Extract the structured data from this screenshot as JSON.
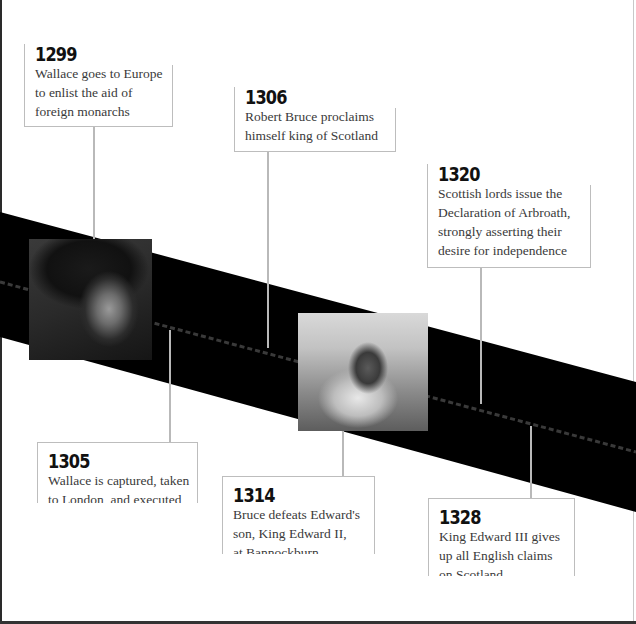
{
  "timeline": {
    "band_color": "#000000",
    "connector_color": "#b9b9b9",
    "events": [
      {
        "year": "1299",
        "description_lines": [
          "Wallace goes to Europe",
          "to enlist the aid of",
          "foreign monarchs"
        ],
        "position": "above"
      },
      {
        "year": "1306",
        "description_lines": [
          "Robert Bruce proclaims",
          "himself king of Scotland"
        ],
        "position": "above"
      },
      {
        "year": "1320",
        "description_lines": [
          "Scottish lords issue the",
          "Declaration of Arbroath,",
          "strongly asserting their",
          "desire for independence"
        ],
        "position": "above"
      },
      {
        "year": "1305",
        "description_lines": [
          "Wallace is captured, taken",
          "to London, and executed"
        ],
        "position": "below"
      },
      {
        "year": "1314",
        "description_lines": [
          "Bruce defeats Edward's",
          "son, King Edward II,",
          "at Bannockburn"
        ],
        "position": "below"
      },
      {
        "year": "1328",
        "description_lines": [
          "King Edward III gives",
          "up all English claims",
          "on Scotland"
        ],
        "position": "below"
      }
    ],
    "images": [
      {
        "name": "portrait-of-william-wallace",
        "alt": "Engraved portrait of William Wallace in helmet"
      },
      {
        "name": "battle-of-bannockburn-engraving",
        "alt": "Engraving of Robert Bruce on horseback in battle"
      }
    ]
  }
}
